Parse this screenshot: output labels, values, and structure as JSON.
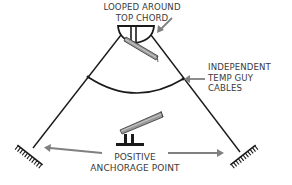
{
  "diagram": {
    "labels": {
      "top": {
        "line1": "LOOPED AROUND",
        "line2": "TOP CHORD"
      },
      "right": {
        "line1": "INDEPENDENT",
        "line2": "TEMP GUY",
        "line3": "CABLES"
      },
      "bottom": {
        "line1": "POSITIVE",
        "line2": "ANCHORAGE POINT"
      }
    },
    "colors": {
      "line": "#1a1a1a",
      "arrow": "#808080",
      "beam_fill": "#9a9a9a",
      "text": "#3a3a3a"
    }
  }
}
